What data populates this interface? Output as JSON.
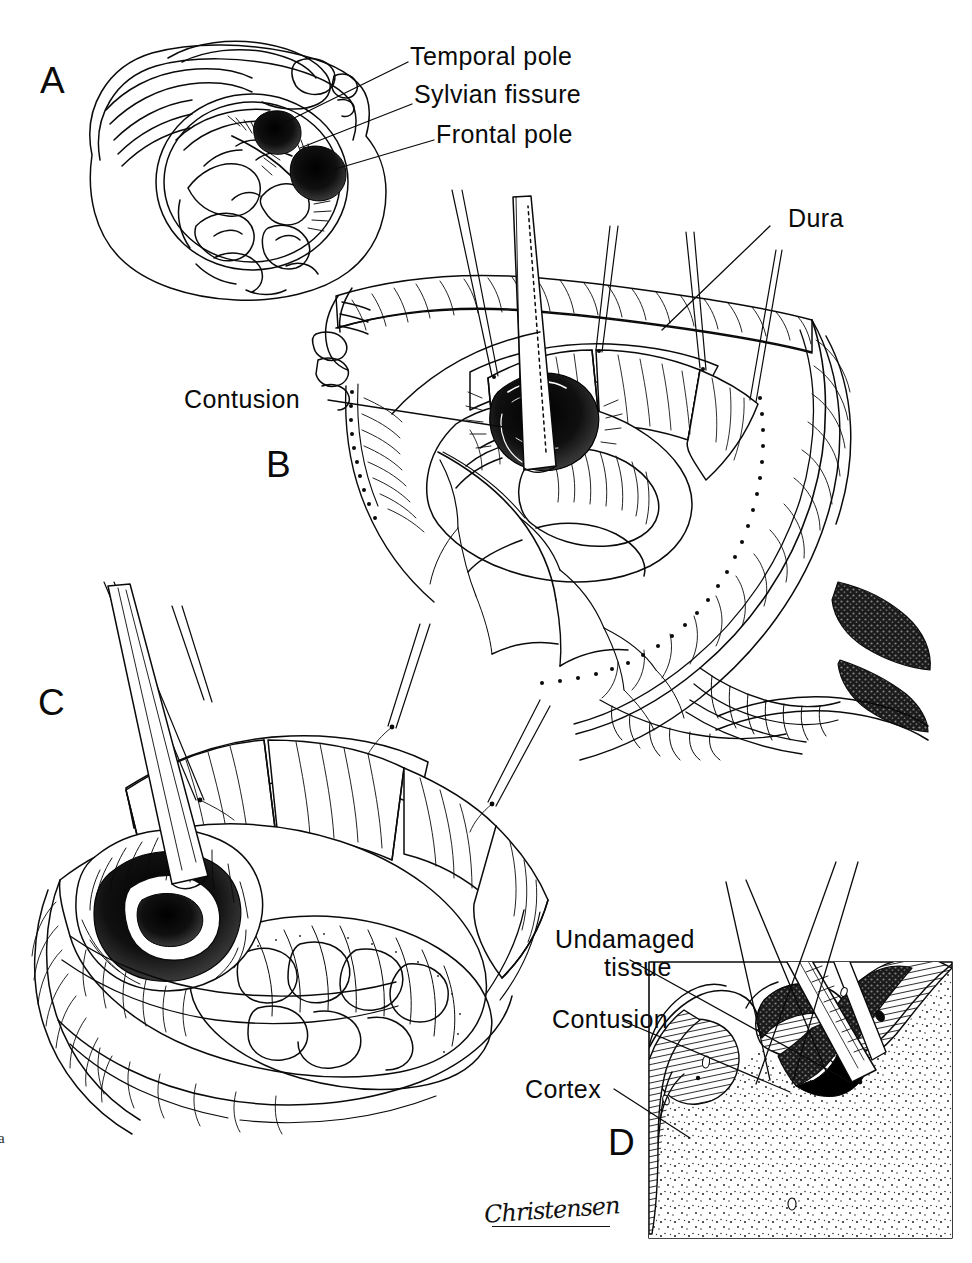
{
  "figure": {
    "kind": "surgical-technique-illustration",
    "background_color": "#ffffff",
    "ink_color": "#0a0a0a"
  },
  "panels": [
    {
      "id": "A",
      "letter": "A",
      "description": "Axial view of brain within cranium showing contusion sites",
      "labels": [
        {
          "text": "Temporal pole",
          "name": "label-temporal-pole"
        },
        {
          "text": "Sylvian fissure",
          "name": "label-sylvian-fissure"
        },
        {
          "text": "Frontal pole",
          "name": "label-frontal-pole"
        }
      ]
    },
    {
      "id": "B",
      "letter": "B",
      "description": "Craniotomy with dura reflected, suction tip in contusion",
      "labels": [
        {
          "text": "Dura",
          "name": "label-dura"
        },
        {
          "text": "Contusion",
          "name": "label-contusion-b"
        }
      ]
    },
    {
      "id": "C",
      "letter": "C",
      "description": "Close-up of contusion evacuation with suction tip",
      "labels": []
    },
    {
      "id": "D",
      "letter": "D",
      "description": "Cross-section through cortex and white matter at contusion",
      "labels": [
        {
          "text": "Undamaged",
          "text_line2": "tissue",
          "name": "label-undamaged-tissue"
        },
        {
          "text": "Contusion",
          "name": "label-contusion-d"
        },
        {
          "text": "Cortex",
          "name": "label-cortex"
        }
      ]
    }
  ],
  "credit": {
    "signature": "Christensen"
  },
  "margin": {
    "mark": "a"
  }
}
